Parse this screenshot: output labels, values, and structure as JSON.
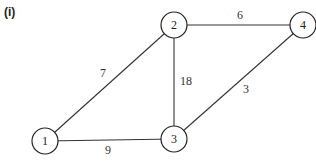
{
  "figure": {
    "label": "(i)"
  },
  "graph": {
    "nodes": [
      {
        "id": "1",
        "label": "1",
        "x": 45,
        "y": 141
      },
      {
        "id": "2",
        "label": "2",
        "x": 174,
        "y": 25
      },
      {
        "id": "3",
        "label": "3",
        "x": 174,
        "y": 139
      },
      {
        "id": "4",
        "label": "4",
        "x": 303,
        "y": 25
      }
    ],
    "edges": [
      {
        "from": "1",
        "to": "2",
        "weight": "7",
        "label_x": 103,
        "label_y": 73
      },
      {
        "from": "2",
        "to": "4",
        "weight": "6",
        "label_x": 240,
        "label_y": 15
      },
      {
        "from": "2",
        "to": "3",
        "weight": "18",
        "label_x": 186,
        "label_y": 81
      },
      {
        "from": "3",
        "to": "4",
        "weight": "3",
        "label_x": 246,
        "label_y": 89
      },
      {
        "from": "1",
        "to": "3",
        "weight": "9",
        "label_x": 108,
        "label_y": 150
      }
    ],
    "node_radius": 13
  }
}
